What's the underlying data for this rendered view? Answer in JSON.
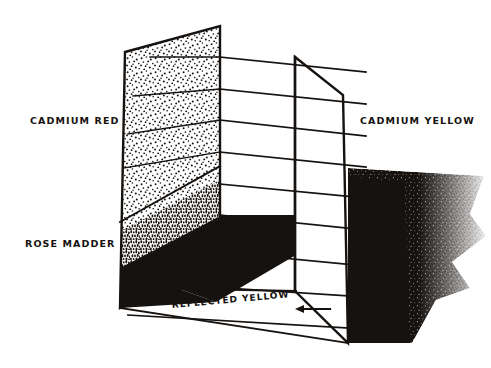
{
  "figure": {
    "title_visible": false,
    "background_color": "#ffffff",
    "ink_color": "#16120f",
    "canvas": {
      "width": 491,
      "height": 368
    }
  },
  "labels": {
    "cadmium_red": "CADMIUM RED",
    "rose_madder": "ROSE MADDER",
    "cadmium_yellow": "CADMIUM YELLOW",
    "reflected_yellow": "REFLECTED YELLOW"
  },
  "icons": {
    "arrow_left": "arrow-left-icon"
  },
  "diagram": {
    "left_panel": {
      "name": "left-upright-panel",
      "points": "125,52 220,26 220,272 120,308",
      "upper_region_label_ref": "labels.cadmium_red",
      "lower_region_label_ref": "labels.rose_madder",
      "divider_points": "120,220 220,165",
      "upper_fill": "light-stipple",
      "lower_fill": "dense-stipple"
    },
    "right_panel": {
      "name": "right-upright-panel",
      "points": "295,57 343,95 348,343 295,291",
      "label_ref": "labels.cadmium_yellow",
      "fill": "none"
    },
    "floor_band": {
      "name": "reflected-light-floor-band",
      "points": "120,268 220,215 296,215 296,255 216,302",
      "fill": "solid-black"
    },
    "shadow": {
      "name": "cast-shadow-region",
      "fill": "feathered-stipple",
      "bounds": {
        "x": 348,
        "y": 168,
        "width": 135,
        "height": 175
      }
    },
    "rays": {
      "name": "light-ray-lines",
      "count": 9,
      "left_x": 220,
      "right_x": 366,
      "y_left": [
        57,
        89,
        120,
        152,
        184,
        215,
        252,
        284,
        315
      ],
      "y_right": [
        72,
        104,
        136,
        167,
        198,
        230,
        266,
        297,
        329
      ]
    },
    "arrow": {
      "name": "reflected-yellow-arrow",
      "tip_x": 297,
      "tip_y": 309,
      "tail_x": 330,
      "tail_y": 309
    }
  }
}
